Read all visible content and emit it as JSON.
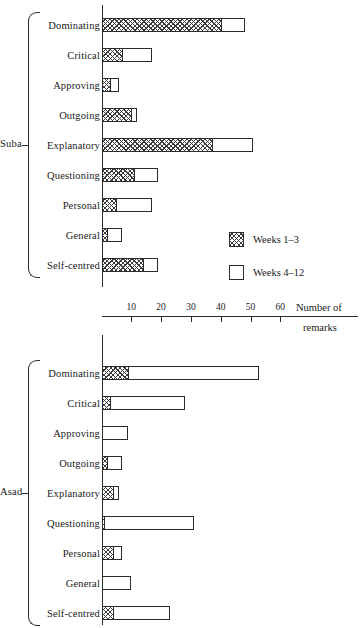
{
  "chart_data": {
    "type": "bar",
    "title": "",
    "subtitle": "",
    "orientation": "horizontal",
    "stacked": true,
    "xlabel": "Number of remarks",
    "ylabel": "",
    "xlim": [
      0,
      70
    ],
    "xticks": [
      10,
      20,
      30,
      40,
      50,
      60
    ],
    "xtick_labels": [
      "10",
      "20",
      "30",
      "40",
      "50",
      "60"
    ],
    "grid": false,
    "legend_position": "inside-right-upper-panel",
    "legend": [
      "Weeks 1-3",
      "Weeks 4-12"
    ],
    "categories": [
      "Dominating",
      "Critical",
      "Approving",
      "Outgoing",
      "Explanatory",
      "Questioning",
      "Personal",
      "General",
      "Self-centred"
    ],
    "panels": [
      {
        "group": "Suba",
        "series": [
          {
            "name": "Weeks 1-3",
            "values": [
              40,
              7,
              3,
              10,
              37,
              11,
              5,
              2,
              14
            ]
          },
          {
            "name": "Weeks 4-12",
            "values": [
              8,
              10,
              3,
              2,
              14,
              8,
              12,
              5,
              5
            ]
          }
        ],
        "totals": [
          48,
          17,
          6,
          12,
          51,
          19,
          17,
          7,
          19
        ]
      },
      {
        "group": "Asad",
        "series": [
          {
            "name": "Weeks 1-3",
            "values": [
              9,
              3,
              0,
              2,
              4,
              1,
              4,
              0,
              4
            ]
          },
          {
            "name": "Weeks 4-12",
            "values": [
              44,
              25,
              9,
              5,
              2,
              30,
              3,
              10,
              19
            ]
          }
        ],
        "totals": [
          53,
          28,
          9,
          7,
          6,
          31,
          7,
          10,
          23
        ]
      }
    ]
  },
  "figure": {
    "axis_title_line1": "Number of",
    "axis_title_line2": "remarks",
    "group_suba": "Suba",
    "group_asad": "Asad"
  },
  "legend": {
    "items": [
      {
        "label": "Weeks 1–3",
        "swatch": "hatched"
      },
      {
        "label": "Weeks 4–12",
        "swatch": "white"
      }
    ]
  },
  "axis": {
    "ticks": [
      {
        "label": "10",
        "value": 10
      },
      {
        "label": "20",
        "value": 20
      },
      {
        "label": "30",
        "value": 30
      },
      {
        "label": "40",
        "value": 40
      },
      {
        "label": "50",
        "value": 50
      },
      {
        "label": "60",
        "value": 60
      }
    ]
  },
  "rows": {
    "suba": [
      {
        "label": "Dominating",
        "w1": 40,
        "w2": 8
      },
      {
        "label": "Critical",
        "w1": 7,
        "w2": 10
      },
      {
        "label": "Approving",
        "w1": 3,
        "w2": 3
      },
      {
        "label": "Outgoing",
        "w1": 10,
        "w2": 2
      },
      {
        "label": "Explanatory",
        "w1": 37,
        "w2": 14
      },
      {
        "label": "Questioning",
        "w1": 11,
        "w2": 8
      },
      {
        "label": "Personal",
        "w1": 5,
        "w2": 12
      },
      {
        "label": "General",
        "w1": 2,
        "w2": 5
      },
      {
        "label": "Self-centred",
        "w1": 14,
        "w2": 5
      }
    ],
    "asad": [
      {
        "label": "Dominating",
        "w1": 9,
        "w2": 44
      },
      {
        "label": "Critical",
        "w1": 3,
        "w2": 25
      },
      {
        "label": "Approving",
        "w1": 0,
        "w2": 9
      },
      {
        "label": "Outgoing",
        "w1": 2,
        "w2": 5
      },
      {
        "label": "Explanatory",
        "w1": 4,
        "w2": 2
      },
      {
        "label": "Questioning",
        "w1": 1,
        "w2": 30
      },
      {
        "label": "Personal",
        "w1": 4,
        "w2": 3
      },
      {
        "label": "General",
        "w1": 0,
        "w2": 10
      },
      {
        "label": "Self-centred",
        "w1": 4,
        "w2": 19
      }
    ]
  }
}
